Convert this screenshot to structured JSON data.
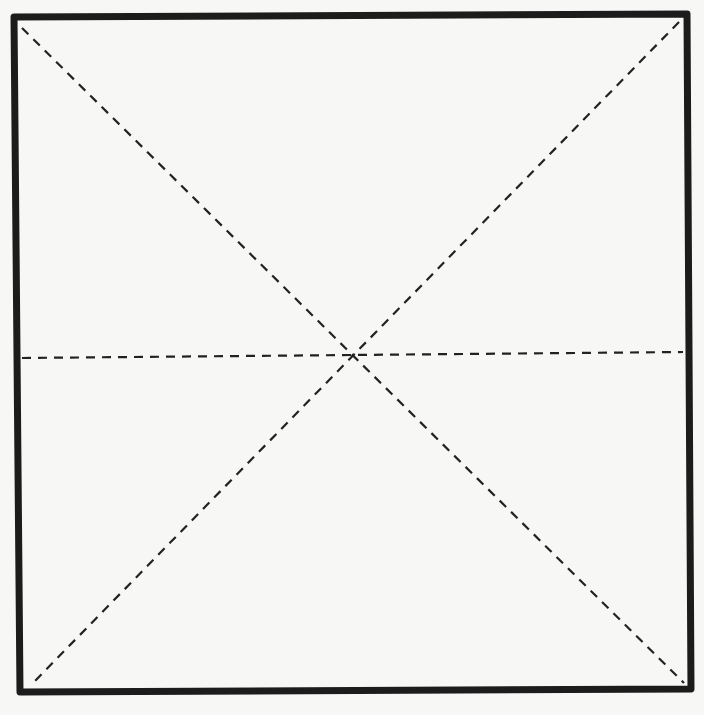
{
  "diagram": {
    "type": "square-with-dashed-fold-lines",
    "background": "#f7f7f5",
    "stroke_color": "#1c1c1c",
    "dash_color": "#222222",
    "square": {
      "corners": {
        "top_left": [
          14,
          17
        ],
        "top_right": [
          687,
          14
        ],
        "bottom_right": [
          691,
          689
        ],
        "bottom_left": [
          20,
          692
        ]
      },
      "stroke_width": 7
    },
    "dashed_lines": [
      {
        "name": "diagonal-tl-br",
        "from": [
          22,
          28
        ],
        "to": [
          684,
          683
        ]
      },
      {
        "name": "diagonal-tr-bl",
        "from": [
          679,
          22
        ],
        "to": [
          31,
          685
        ]
      },
      {
        "name": "horizontal-midline",
        "from": [
          22,
          358
        ],
        "to": [
          683,
          352
        ]
      }
    ],
    "dash_pattern": "9 7",
    "dash_width": 2.2,
    "center": [
      353,
      355
    ]
  }
}
